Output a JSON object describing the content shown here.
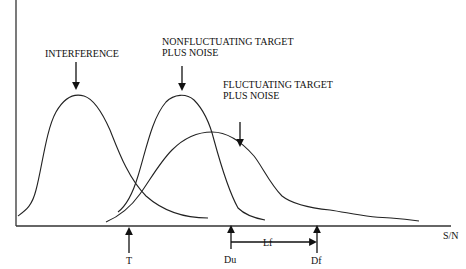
{
  "diagram": {
    "x_axis_label": "S/N",
    "labels": {
      "interference": "INTERFERENCE",
      "nonfluct_line1": "NONFLUCTUATING TARGET",
      "nonfluct_line2": "PLUS NOISE",
      "fluct_line1": "FLUCTUATING TARGET",
      "fluct_line2": "PLUS NOISE"
    },
    "markers": {
      "threshold": "T",
      "du": "Du",
      "df": "Df",
      "loss": "Lf"
    },
    "curves": [
      {
        "name": "interference",
        "label": "INTERFERENCE"
      },
      {
        "name": "nonfluctuating-target-plus-noise",
        "label": "NONFLUCTUATING TARGET PLUS NOISE"
      },
      {
        "name": "fluctuating-target-plus-noise",
        "label": "FLUCTUATING TARGET PLUS NOISE"
      }
    ],
    "colors": {
      "line": "#222222",
      "background": "#ffffff"
    }
  }
}
